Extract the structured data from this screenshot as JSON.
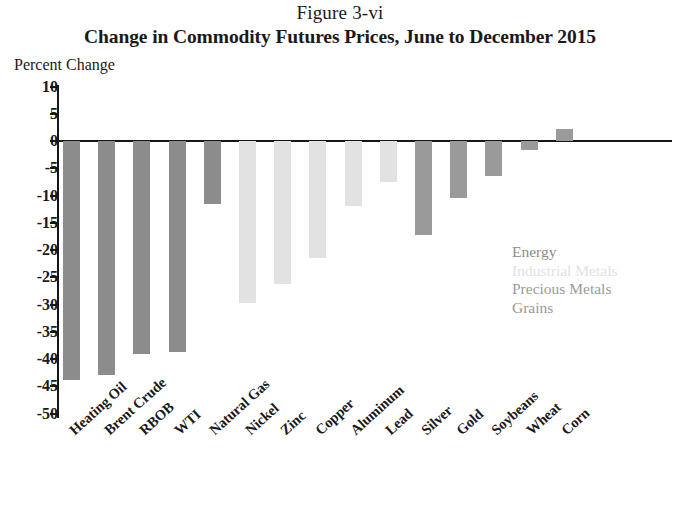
{
  "figure": {
    "number": "Figure 3-vi",
    "title": "Change in Commodity Futures Prices, June to December 2015",
    "axis_unit_label": "Percent Change"
  },
  "legend": {
    "position": "inside-right",
    "entries": [
      {
        "label": "Energy",
        "color": "#8c8c8c"
      },
      {
        "label": "Industrial Metals",
        "color": "#e2e2e2"
      },
      {
        "label": "Precious Metals",
        "color": "#9a9a9a"
      },
      {
        "label": "Grains",
        "color": "#9a9a9a"
      }
    ]
  },
  "chart_data": {
    "type": "bar",
    "title": "Change in Commodity Futures Prices, June to December 2015",
    "subtitle": "Figure 3-vi",
    "xlabel": "",
    "ylabel": "Percent Change",
    "ylim": [
      -50,
      10
    ],
    "ytick_step": 5,
    "yticks": [
      10,
      5,
      0,
      -5,
      -10,
      -15,
      -20,
      -25,
      -30,
      -35,
      -40,
      -45,
      -50
    ],
    "ytick_labels": [
      "10",
      "5",
      "0",
      "-5",
      "-10",
      "-15",
      "-20",
      "-25",
      "-30",
      "-35",
      "-40",
      "-45",
      "-50"
    ],
    "grid": false,
    "categories": [
      "Heating Oil",
      "Brent Crude",
      "RBOB",
      "WTI",
      "Natural Gas",
      "Nickel",
      "Zinc",
      "Copper",
      "Aluminum",
      "Lead",
      "Silver",
      "Gold",
      "Soybeans",
      "Wheat",
      "Corn"
    ],
    "values": [
      -43.8,
      -43.0,
      -39.0,
      -38.7,
      -11.5,
      -29.7,
      -26.2,
      -21.5,
      -12.0,
      -7.5,
      -17.2,
      -10.5,
      -6.5,
      -1.6,
      2.2
    ],
    "groups": [
      "Energy",
      "Energy",
      "Energy",
      "Energy",
      "Energy",
      "Industrial Metals",
      "Industrial Metals",
      "Industrial Metals",
      "Industrial Metals",
      "Industrial Metals",
      "Precious Metals",
      "Precious Metals",
      "Grains",
      "Grains",
      "Grains"
    ],
    "group_colors": {
      "Energy": "#8c8c8c",
      "Industrial Metals": "#e2e2e2",
      "Precious Metals": "#9a9a9a",
      "Grains": "#9a9a9a"
    }
  }
}
